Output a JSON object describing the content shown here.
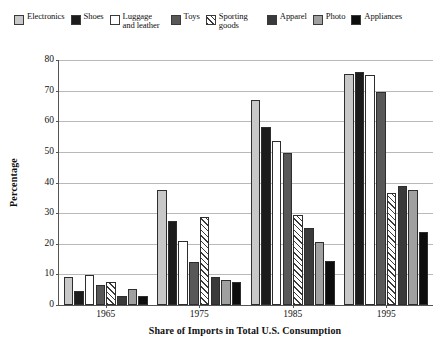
{
  "chart_data": {
    "type": "bar",
    "title": "",
    "xlabel": "Share of Imports in Total U.S. Consumption",
    "ylabel": "Percentage",
    "categories": [
      "1965",
      "1975",
      "1985",
      "1995"
    ],
    "ylim": [
      0,
      80
    ],
    "yticks": [
      0,
      10,
      20,
      30,
      40,
      50,
      60,
      70,
      80
    ],
    "grid": true,
    "legend_position": "top",
    "series": [
      {
        "name": "Electronics",
        "color": "#c8c8c8",
        "pattern": "solid",
        "values": [
          9,
          37.5,
          67,
          75.5
        ]
      },
      {
        "name": "Shoes",
        "color": "#1c1c1c",
        "pattern": "solid",
        "values": [
          4.5,
          27.5,
          58,
          76
        ]
      },
      {
        "name": "Luggage and leather",
        "color": "#ffffff",
        "pattern": "solid",
        "values": [
          9.8,
          21,
          53.5,
          75
        ]
      },
      {
        "name": "Toys",
        "color": "#585858",
        "pattern": "solid",
        "values": [
          6.6,
          14.2,
          49.5,
          69.5
        ]
      },
      {
        "name": "Sporting goods",
        "color": "#ffffff",
        "pattern": "diagonal-hatch",
        "values": [
          7.4,
          28.8,
          29.5,
          36.5
        ]
      },
      {
        "name": "Apparel",
        "color": "#3a3a3a",
        "pattern": "solid",
        "values": [
          3.1,
          9.2,
          25,
          39
        ]
      },
      {
        "name": "Photo",
        "color": "#a0a0a0",
        "pattern": "solid",
        "values": [
          5.3,
          8.1,
          20.5,
          37.5
        ]
      },
      {
        "name": "Appliances",
        "color": "#0d0d0d",
        "pattern": "solid",
        "values": [
          3.0,
          7.5,
          14.5,
          24
        ]
      }
    ]
  }
}
